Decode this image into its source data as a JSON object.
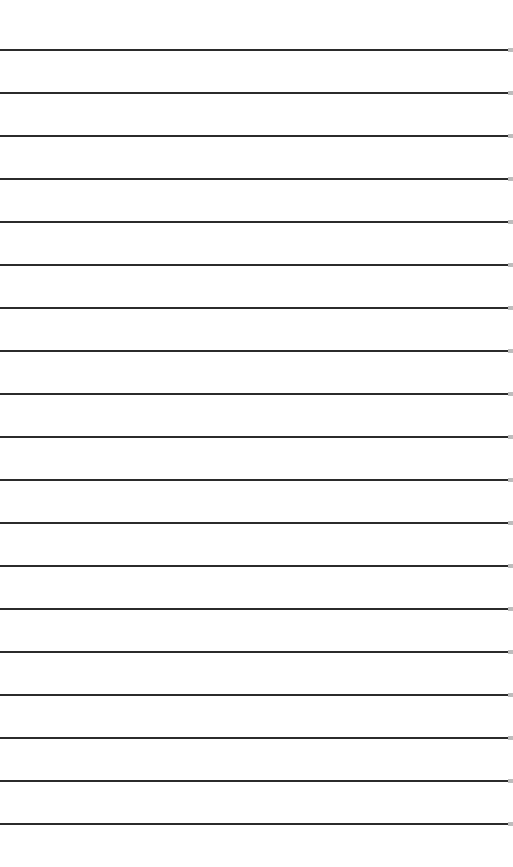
{
  "sheet": {
    "background": "#ffffff",
    "line_color": "#2b2b2b",
    "lines": [
      49,
      92,
      135,
      178,
      221,
      264,
      307,
      350,
      393,
      436,
      479,
      522,
      565,
      608,
      651,
      694,
      737,
      780,
      823
    ]
  }
}
